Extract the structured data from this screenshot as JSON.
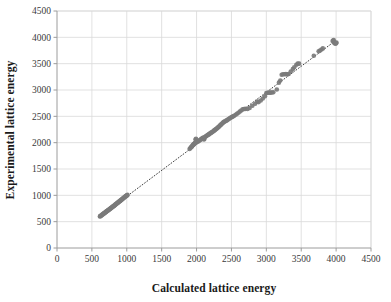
{
  "chart_data": {
    "type": "scatter",
    "title": "",
    "xlabel": "Calculated lattice energy",
    "ylabel": "Experimental lattice energy",
    "xlim": [
      0,
      4500
    ],
    "ylim": [
      0,
      4500
    ],
    "xticks": [
      0,
      500,
      1000,
      1500,
      2000,
      2500,
      3000,
      3500,
      4000,
      4500
    ],
    "yticks": [
      0,
      500,
      1000,
      1500,
      2000,
      2500,
      3000,
      3500,
      4000,
      4500
    ],
    "xtick_labels": [
      "0",
      "500",
      "1000",
      "1500",
      "2000",
      "2500",
      "3000",
      "3500",
      "4000",
      "4500"
    ],
    "ytick_labels": [
      "0",
      "500",
      "1000",
      "1500",
      "2000",
      "2500",
      "3000",
      "3500",
      "4000",
      "4500"
    ],
    "grid": "both",
    "legend": "none",
    "marker_color": "#7b7b7b",
    "marker_size": 4.6,
    "gridline_color": "#d9d9d9",
    "axis_color": "#9c9c9c",
    "trendline": {
      "style": "dotted",
      "color": "#3d3d3d",
      "x": [
        600,
        4010
      ],
      "y": [
        585,
        3955
      ]
    },
    "points": [
      [
        615,
        600
      ],
      [
        622,
        605
      ],
      [
        628,
        612
      ],
      [
        634,
        618
      ],
      [
        640,
        622
      ],
      [
        646,
        630
      ],
      [
        652,
        636
      ],
      [
        658,
        642
      ],
      [
        664,
        648
      ],
      [
        670,
        652
      ],
      [
        676,
        660
      ],
      [
        682,
        666
      ],
      [
        688,
        670
      ],
      [
        694,
        678
      ],
      [
        700,
        684
      ],
      [
        706,
        690
      ],
      [
        712,
        696
      ],
      [
        718,
        702
      ],
      [
        724,
        708
      ],
      [
        730,
        714
      ],
      [
        736,
        720
      ],
      [
        742,
        726
      ],
      [
        748,
        732
      ],
      [
        754,
        738
      ],
      [
        760,
        744
      ],
      [
        766,
        750
      ],
      [
        772,
        756
      ],
      [
        778,
        762
      ],
      [
        784,
        768
      ],
      [
        790,
        774
      ],
      [
        796,
        780
      ],
      [
        802,
        786
      ],
      [
        808,
        792
      ],
      [
        814,
        798
      ],
      [
        820,
        804
      ],
      [
        826,
        812
      ],
      [
        832,
        818
      ],
      [
        838,
        824
      ],
      [
        844,
        830
      ],
      [
        850,
        838
      ],
      [
        856,
        844
      ],
      [
        862,
        850
      ],
      [
        868,
        856
      ],
      [
        874,
        862
      ],
      [
        880,
        868
      ],
      [
        886,
        876
      ],
      [
        892,
        882
      ],
      [
        898,
        888
      ],
      [
        904,
        894
      ],
      [
        910,
        900
      ],
      [
        916,
        908
      ],
      [
        922,
        914
      ],
      [
        928,
        920
      ],
      [
        934,
        926
      ],
      [
        940,
        934
      ],
      [
        946,
        940
      ],
      [
        952,
        948
      ],
      [
        958,
        954
      ],
      [
        964,
        960
      ],
      [
        970,
        968
      ],
      [
        976,
        974
      ],
      [
        982,
        980
      ],
      [
        988,
        986
      ],
      [
        994,
        992
      ],
      [
        1000,
        998
      ],
      [
        1005,
        1002
      ],
      [
        1010,
        1008
      ],
      [
        1900,
        1880
      ],
      [
        1912,
        1900
      ],
      [
        1920,
        1912
      ],
      [
        1928,
        1920
      ],
      [
        1935,
        1932
      ],
      [
        1942,
        1945
      ],
      [
        1948,
        1955
      ],
      [
        1955,
        1962
      ],
      [
        1960,
        1970
      ],
      [
        1966,
        1978
      ],
      [
        1972,
        1985
      ],
      [
        1978,
        1992
      ],
      [
        1984,
        1998
      ],
      [
        1990,
        2005
      ],
      [
        1996,
        2010
      ],
      [
        1985,
        2060
      ],
      [
        1992,
        2075
      ],
      [
        2020,
        2020
      ],
      [
        2030,
        2030
      ],
      [
        2040,
        2042
      ],
      [
        2050,
        2052
      ],
      [
        2060,
        2060
      ],
      [
        2070,
        2072
      ],
      [
        2080,
        2080
      ],
      [
        2090,
        2090
      ],
      [
        2098,
        2098
      ],
      [
        2105,
        2062
      ],
      [
        2112,
        2070
      ],
      [
        2120,
        2108
      ],
      [
        2130,
        2118
      ],
      [
        2140,
        2128
      ],
      [
        2150,
        2135
      ],
      [
        2160,
        2145
      ],
      [
        2170,
        2152
      ],
      [
        2180,
        2162
      ],
      [
        2190,
        2172
      ],
      [
        2200,
        2180
      ],
      [
        2210,
        2190
      ],
      [
        2220,
        2198
      ],
      [
        2230,
        2208
      ],
      [
        2240,
        2218
      ],
      [
        2250,
        2228
      ],
      [
        2260,
        2238
      ],
      [
        2270,
        2248
      ],
      [
        2280,
        2258
      ],
      [
        2290,
        2268
      ],
      [
        2300,
        2280
      ],
      [
        2310,
        2292
      ],
      [
        2320,
        2302
      ],
      [
        2330,
        2318
      ],
      [
        2340,
        2330
      ],
      [
        2350,
        2342
      ],
      [
        2360,
        2355
      ],
      [
        2370,
        2368
      ],
      [
        2380,
        2380
      ],
      [
        2390,
        2392
      ],
      [
        2400,
        2400
      ],
      [
        2412,
        2408
      ],
      [
        2425,
        2418
      ],
      [
        2438,
        2428
      ],
      [
        2450,
        2440
      ],
      [
        2462,
        2450
      ],
      [
        2475,
        2462
      ],
      [
        2488,
        2472
      ],
      [
        2500,
        2482
      ],
      [
        2512,
        2492
      ],
      [
        2525,
        2500
      ],
      [
        2540,
        2512
      ],
      [
        2560,
        2530
      ],
      [
        2580,
        2548
      ],
      [
        2600,
        2568
      ],
      [
        2620,
        2590
      ],
      [
        2640,
        2612
      ],
      [
        2660,
        2632
      ],
      [
        2680,
        2640
      ],
      [
        2700,
        2642
      ],
      [
        2730,
        2640
      ],
      [
        2760,
        2660
      ],
      [
        2800,
        2700
      ],
      [
        2840,
        2740
      ],
      [
        2870,
        2780
      ],
      [
        2890,
        2770
      ],
      [
        2920,
        2800
      ],
      [
        2950,
        2840
      ],
      [
        2980,
        2880
      ],
      [
        3000,
        2940
      ],
      [
        3020,
        2948
      ],
      [
        3040,
        2950
      ],
      [
        3060,
        2950
      ],
      [
        3080,
        2952
      ],
      [
        3100,
        2958
      ],
      [
        3150,
        3010
      ],
      [
        3180,
        3140
      ],
      [
        3200,
        3180
      ],
      [
        3220,
        3290
      ],
      [
        3240,
        3300
      ],
      [
        3260,
        3300
      ],
      [
        3280,
        3302
      ],
      [
        3300,
        3300
      ],
      [
        3320,
        3305
      ],
      [
        3350,
        3350
      ],
      [
        3380,
        3400
      ],
      [
        3400,
        3430
      ],
      [
        3430,
        3480
      ],
      [
        3450,
        3500
      ],
      [
        3470,
        3500
      ],
      [
        3680,
        3650
      ],
      [
        3750,
        3735
      ],
      [
        3770,
        3750
      ],
      [
        3790,
        3770
      ],
      [
        3810,
        3790
      ],
      [
        3950,
        3930
      ],
      [
        3960,
        3940
      ],
      [
        3965,
        3950
      ],
      [
        3970,
        3900
      ],
      [
        3980,
        3890
      ],
      [
        3990,
        3880
      ],
      [
        4000,
        3890
      ],
      [
        4005,
        3900
      ]
    ]
  },
  "layout": {
    "plot_left": 57,
    "plot_top": 11,
    "plot_right": 371,
    "plot_bottom": 248
  }
}
